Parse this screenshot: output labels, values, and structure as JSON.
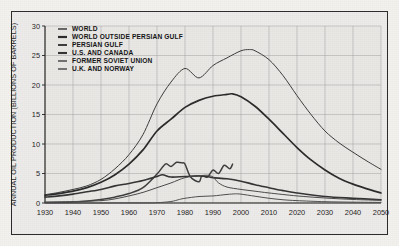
{
  "chart_data": {
    "type": "line",
    "title": "",
    "xlabel": "",
    "ylabel": "ANNUAL OIL PRODUCTION (BILLIONS OF BARRELS)",
    "xlim": [
      1930,
      2050
    ],
    "ylim": [
      0,
      30
    ],
    "xticks": [
      1930,
      1940,
      1950,
      1960,
      1970,
      1980,
      1990,
      2000,
      2010,
      2020,
      2030,
      2040,
      2050
    ],
    "yticks": [
      0,
      5,
      10,
      15,
      20,
      25,
      30
    ],
    "grid": true,
    "legend_position": "upper-left",
    "series": [
      {
        "name": "WORLD",
        "color": "#3b3b3b",
        "width": 1.0,
        "x": [
          1930,
          1935,
          1940,
          1945,
          1950,
          1955,
          1960,
          1965,
          1970,
          1975,
          1980,
          1985,
          1990,
          1995,
          2000,
          2003,
          2005,
          2010,
          2015,
          2020,
          2025,
          2030,
          2035,
          2040,
          2045,
          2050
        ],
        "y": [
          1.4,
          1.8,
          2.3,
          2.9,
          4.0,
          5.8,
          8.2,
          11.6,
          16.8,
          20.5,
          22.8,
          21.2,
          23.3,
          24.6,
          25.8,
          26.0,
          25.8,
          24.3,
          21.6,
          18.2,
          15.0,
          12.2,
          10.2,
          8.6,
          7.1,
          5.7
        ]
      },
      {
        "name": "WORLD OUTSIDE PERSIAN GULF",
        "color": "#2a2a2a",
        "width": 1.7,
        "x": [
          1930,
          1935,
          1940,
          1945,
          1950,
          1955,
          1960,
          1965,
          1970,
          1975,
          1980,
          1985,
          1990,
          1995,
          1997,
          2000,
          2005,
          2010,
          2015,
          2020,
          2025,
          2030,
          2035,
          2040,
          2045,
          2050
        ],
        "y": [
          1.3,
          1.6,
          2.0,
          2.6,
          3.5,
          4.8,
          6.6,
          9.0,
          12.2,
          14.2,
          16.2,
          17.4,
          18.1,
          18.4,
          18.5,
          18.0,
          16.4,
          14.2,
          11.8,
          9.4,
          7.3,
          5.6,
          4.2,
          3.2,
          2.4,
          1.7
        ]
      },
      {
        "name": "PERSIAN GULF",
        "color": "#3d3d3d",
        "width": 1.5,
        "x": [
          1930,
          1940,
          1950,
          1955,
          1960,
          1965,
          1970,
          1973,
          1975,
          1977,
          1979,
          1980,
          1982,
          1985,
          1986,
          1988,
          1990,
          1992,
          1994,
          1996,
          1997
        ],
        "y": [
          0.08,
          0.15,
          0.6,
          1.0,
          1.6,
          2.6,
          4.9,
          6.6,
          6.2,
          6.9,
          6.8,
          6.6,
          4.4,
          3.6,
          4.6,
          4.4,
          5.6,
          5.0,
          6.4,
          5.8,
          6.6
        ]
      },
      {
        "name": "U.S. AND CANADA",
        "color": "#333333",
        "width": 1.6,
        "x": [
          1930,
          1935,
          1940,
          1945,
          1950,
          1955,
          1960,
          1965,
          1970,
          1972,
          1975,
          1980,
          1985,
          1988,
          1990,
          1995,
          2000,
          2005,
          2010,
          2015,
          2020,
          2030,
          2040,
          2050
        ],
        "y": [
          1.0,
          1.2,
          1.5,
          1.9,
          2.3,
          2.9,
          3.3,
          3.8,
          4.5,
          4.8,
          4.4,
          4.5,
          4.6,
          4.5,
          4.3,
          4.1,
          3.7,
          3.1,
          2.6,
          2.1,
          1.7,
          1.1,
          0.8,
          0.55
        ]
      },
      {
        "name": "FORMER SOVIET UNION",
        "color": "#4a4a4a",
        "width": 1.0,
        "x": [
          1930,
          1940,
          1950,
          1955,
          1960,
          1965,
          1970,
          1975,
          1980,
          1985,
          1988,
          1990,
          1992,
          1995,
          2000,
          2005,
          2010,
          2020,
          2030,
          2040,
          2050
        ],
        "y": [
          0.15,
          0.25,
          0.4,
          0.7,
          1.2,
          1.8,
          2.6,
          3.4,
          4.3,
          4.6,
          4.7,
          4.4,
          3.4,
          2.7,
          2.3,
          2.0,
          1.7,
          1.2,
          0.85,
          0.6,
          0.45
        ]
      },
      {
        "name": "U.K. AND NORWAY",
        "color": "#4f4f4f",
        "width": 1.0,
        "x": [
          1930,
          1950,
          1965,
          1970,
          1975,
          1978,
          1980,
          1985,
          1990,
          1995,
          1998,
          2000,
          2005,
          2010,
          2015,
          2020,
          2030,
          2040,
          2050
        ],
        "y": [
          0.0,
          0.0,
          0.02,
          0.05,
          0.25,
          0.6,
          0.8,
          1.1,
          1.2,
          1.45,
          1.55,
          1.5,
          1.15,
          0.8,
          0.55,
          0.4,
          0.22,
          0.14,
          0.1
        ]
      }
    ]
  },
  "legend": {
    "items": [
      {
        "label": "WORLD"
      },
      {
        "label": "WORLD OUTSIDE PERSIAN GULF"
      },
      {
        "label": "PERSIAN GULF"
      },
      {
        "label": "U.S. AND CANADA"
      },
      {
        "label": "FORMER SOVIET UNION"
      },
      {
        "label": "U.K. AND NORWAY"
      }
    ]
  },
  "colors": {
    "frame": "#2b2b2b",
    "background": "#edecea",
    "grid": "#8e8e8e",
    "axis": "#1f1f1f"
  }
}
